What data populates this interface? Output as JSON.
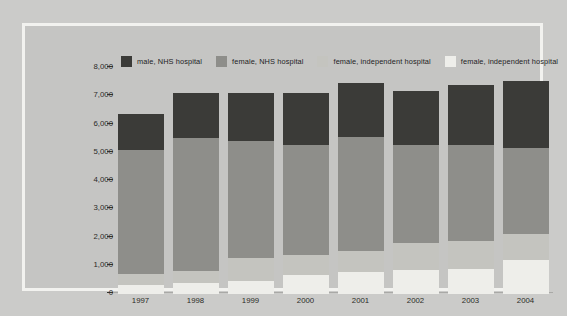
{
  "chart_data": {
    "type": "bar",
    "subtype": "stacked-bar",
    "title": "",
    "xlabel": "",
    "ylabel": "",
    "ylim": [
      0,
      8000
    ],
    "ytick_labels": [
      "8,000",
      "7,000",
      "6,000",
      "5,000",
      "4,000",
      "3,000",
      "2,000",
      "1,000",
      "0"
    ],
    "ytick_values": [
      8000,
      7000,
      6000,
      5000,
      4000,
      3000,
      2000,
      1000,
      0
    ],
    "grid": false,
    "legend_position": "top",
    "categories": [
      "1997",
      "1998",
      "1999",
      "2000",
      "2001",
      "2002",
      "2003",
      "2004"
    ],
    "series": [
      {
        "name": "female, independent hospital",
        "legend_index": 4,
        "color": "#eeeeea",
        "values": [
          330,
          400,
          450,
          690,
          780,
          840,
          870,
          1190
        ]
      },
      {
        "name": "female, independent hospital",
        "legend_index": 3,
        "color": "#c4c4bf",
        "values": [
          720,
          820,
          1270,
          1390,
          1530,
          1800,
          1880,
          2140
        ]
      },
      {
        "name": "female, NHS hospital",
        "legend_index": 2,
        "color": "#8e8e8a",
        "values": [
          5110,
          5540,
          5430,
          5270,
          5560,
          5270,
          5260,
          5180
        ]
      },
      {
        "name": "male, NHS hospital",
        "legend_index": 1,
        "color": "#3b3b38",
        "values": [
          6390,
          7130,
          7130,
          7130,
          7470,
          7200,
          7390,
          7540
        ]
      }
    ],
    "stack_tops": {
      "1997": {
        "lightest": 330,
        "light": 720,
        "mid": 5110,
        "dark": 6390
      },
      "1998": {
        "lightest": 400,
        "light": 820,
        "mid": 5540,
        "dark": 7130
      },
      "1999": {
        "lightest": 450,
        "light": 1270,
        "mid": 5430,
        "dark": 7130
      },
      "2000": {
        "lightest": 690,
        "light": 1390,
        "mid": 5270,
        "dark": 7130
      },
      "2001": {
        "lightest": 780,
        "light": 1530,
        "mid": 5560,
        "dark": 7470
      },
      "2002": {
        "lightest": 840,
        "light": 1800,
        "mid": 5270,
        "dark": 7200
      },
      "2003": {
        "lightest": 870,
        "light": 1880,
        "mid": 5260,
        "dark": 7390
      },
      "2004": {
        "lightest": 1190,
        "light": 2140,
        "mid": 5180,
        "dark": 7540
      }
    }
  },
  "legend": {
    "items": [
      {
        "label": "male, NHS hospital",
        "color": "#3b3b38",
        "swatch_name": "legend-swatch-male-nhs"
      },
      {
        "label": "female, NHS hospital",
        "color": "#8e8e8a",
        "swatch_name": "legend-swatch-female-nhs"
      },
      {
        "label": "female, independent hospital",
        "color": "#c4c4bf",
        "swatch_name": "legend-swatch-female-independent-1"
      },
      {
        "label": "female, independent hospital",
        "color": "#eeeeea",
        "swatch_name": "legend-swatch-female-independent-2"
      }
    ]
  },
  "colors": {
    "page_background": "#cbcbc9",
    "frame_border": "#f2f2ef",
    "plot_background": "#c5c5c3",
    "axis_text": "#2b2b27",
    "tick_mark": "#33332f"
  }
}
